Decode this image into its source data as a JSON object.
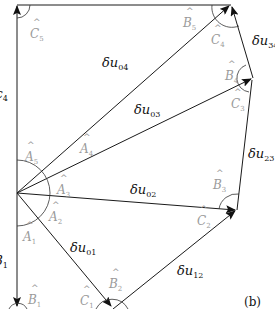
{
  "diagram": {
    "panel_label": "(b)",
    "vectors": [
      {
        "id": "du01",
        "base": "δu",
        "sub": "01"
      },
      {
        "id": "du02",
        "base": "δu",
        "sub": "02"
      },
      {
        "id": "du03",
        "base": "δu",
        "sub": "03"
      },
      {
        "id": "du04",
        "base": "δu",
        "sub": "04"
      },
      {
        "id": "du12",
        "base": "δu",
        "sub": "12"
      },
      {
        "id": "du23",
        "base": "δu",
        "sub": "23"
      },
      {
        "id": "du34",
        "base": "δu",
        "sub": "34"
      }
    ],
    "angles": [
      {
        "id": "A1",
        "base": "A",
        "sub": "1"
      },
      {
        "id": "A2",
        "base": "A",
        "sub": "2"
      },
      {
        "id": "A3",
        "base": "A",
        "sub": "3"
      },
      {
        "id": "A4",
        "base": "A",
        "sub": "4"
      },
      {
        "id": "A5",
        "base": "A",
        "sub": "5"
      },
      {
        "id": "B1",
        "base": "B",
        "sub": "1"
      },
      {
        "id": "B2",
        "base": "B",
        "sub": "2"
      },
      {
        "id": "B3",
        "base": "B",
        "sub": "3"
      },
      {
        "id": "B4",
        "base": "B",
        "sub": "4"
      },
      {
        "id": "B5",
        "base": "B",
        "sub": "5"
      },
      {
        "id": "C1",
        "base": "C",
        "sub": "1"
      },
      {
        "id": "C2",
        "base": "C",
        "sub": "2"
      },
      {
        "id": "C3",
        "base": "C",
        "sub": "3"
      },
      {
        "id": "C4",
        "base": "C",
        "sub": "4"
      },
      {
        "id": "C5",
        "base": "C",
        "sub": "5"
      }
    ],
    "cut_edge_labels": [
      {
        "id": "left-upper",
        "text": "4"
      },
      {
        "id": "left-lower",
        "text": "1"
      }
    ],
    "hat_glyph": "^"
  }
}
